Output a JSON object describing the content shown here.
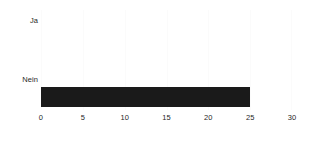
{
  "chart_data": {
    "type": "bar",
    "orientation": "horizontal",
    "title": "",
    "subtitle": "",
    "xlabel": "",
    "ylabel": "",
    "categories": [
      "Ja",
      "Nein"
    ],
    "values": [
      0,
      25
    ],
    "series": [
      {
        "name": "",
        "values": [
          0,
          25
        ]
      }
    ],
    "xlim": [
      0,
      30
    ],
    "xticks": [
      0,
      5,
      10,
      15,
      20,
      25,
      30
    ],
    "xtick_labels": [
      "0",
      "5",
      "10",
      "15",
      "20",
      "25",
      "30"
    ],
    "grid": true,
    "grid_axis": "x",
    "legend": false,
    "legend_position": "none",
    "annotations": [],
    "colors": {
      "bar": "#1a1a1a",
      "background": "#ffffff",
      "text": "#1f1f1f",
      "gridline": "#fbfbfb"
    }
  }
}
